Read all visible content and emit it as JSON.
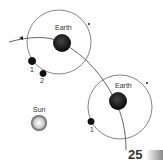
{
  "diagram": {
    "earth_label_1": "Earth",
    "earth_label_2": "Earth",
    "sun_label": "Sun",
    "moon_labels_1": [
      "1",
      "2"
    ],
    "moon_labels_2": [
      "1"
    ]
  },
  "page": {
    "number": "25"
  },
  "colors": {
    "earth": "#1a1a1a",
    "orbit_line": "#555555",
    "sun_gradient": "#bbbbbb"
  }
}
